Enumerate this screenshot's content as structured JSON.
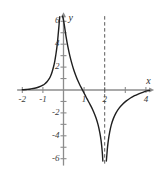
{
  "chart_data": {
    "type": "line",
    "title": "",
    "xlabel": "x",
    "ylabel": "y",
    "xlim": [
      -2.25,
      4.4
    ],
    "ylim": [
      -6.6,
      6.8
    ],
    "grid": false,
    "legend": null,
    "axis_color": "#8c8c8c",
    "curve_color": "#1f1f1f",
    "asymptote_color": "#5a5a5a",
    "x_ticks": [
      -2,
      -1,
      0,
      1,
      2,
      3,
      4
    ],
    "x_tick_labels": [
      "-2",
      "-1",
      "",
      "1",
      "2",
      "",
      "4"
    ],
    "y_ticks": [
      -6,
      -5,
      -4,
      -3,
      -2,
      -1,
      1,
      2,
      3,
      4,
      5,
      6
    ],
    "y_tick_labels": [
      "-6",
      "",
      "-4",
      "",
      "-2",
      "",
      "",
      "2",
      "",
      "4",
      "",
      "6"
    ],
    "asymptotes": [
      {
        "kind": "vertical",
        "x": 2,
        "style": "dashed"
      }
    ],
    "series": [
      {
        "name": "branch-left",
        "comment": "x from -2 to just left of 0, rising from y≈0 to y≈6.4",
        "points": [
          [
            -2.0,
            0.02
          ],
          [
            -1.8,
            0.05
          ],
          [
            -1.6,
            0.09
          ],
          [
            -1.4,
            0.15
          ],
          [
            -1.2,
            0.26
          ],
          [
            -1.0,
            0.42
          ],
          [
            -0.9,
            0.55
          ],
          [
            -0.8,
            0.72
          ],
          [
            -0.7,
            0.97
          ],
          [
            -0.62,
            1.25
          ],
          [
            -0.55,
            1.6
          ],
          [
            -0.48,
            2.05
          ],
          [
            -0.42,
            2.55
          ],
          [
            -0.37,
            3.1
          ],
          [
            -0.32,
            3.75
          ],
          [
            -0.28,
            4.4
          ],
          [
            -0.25,
            5.0
          ],
          [
            -0.22,
            5.6
          ],
          [
            -0.2,
            6.05
          ],
          [
            -0.18,
            6.4
          ]
        ]
      },
      {
        "name": "branch-middle",
        "comment": "x from just right of 0 down through zero near x=1 to y≈-6 near x=2",
        "points": [
          [
            -0.05,
            6.45
          ],
          [
            0.0,
            6.1
          ],
          [
            0.05,
            5.55
          ],
          [
            0.12,
            4.7
          ],
          [
            0.2,
            3.9
          ],
          [
            0.3,
            3.05
          ],
          [
            0.4,
            2.35
          ],
          [
            0.5,
            1.75
          ],
          [
            0.6,
            1.25
          ],
          [
            0.7,
            0.8
          ],
          [
            0.8,
            0.42
          ],
          [
            0.9,
            0.08
          ],
          [
            0.95,
            -0.1
          ],
          [
            1.05,
            -0.45
          ],
          [
            1.15,
            -0.8
          ],
          [
            1.3,
            -1.3
          ],
          [
            1.45,
            -1.85
          ],
          [
            1.58,
            -2.45
          ],
          [
            1.68,
            -3.05
          ],
          [
            1.76,
            -3.7
          ],
          [
            1.82,
            -4.35
          ],
          [
            1.86,
            -5.0
          ],
          [
            1.89,
            -5.6
          ],
          [
            1.91,
            -6.2
          ]
        ]
      },
      {
        "name": "branch-right",
        "comment": "x from just right of 2 rising from y≈-6 toward y≈0 at x≈4",
        "points": [
          [
            2.08,
            -6.2
          ],
          [
            2.11,
            -5.55
          ],
          [
            2.14,
            -4.95
          ],
          [
            2.18,
            -4.35
          ],
          [
            2.24,
            -3.7
          ],
          [
            2.32,
            -3.05
          ],
          [
            2.42,
            -2.5
          ],
          [
            2.55,
            -2.0
          ],
          [
            2.7,
            -1.58
          ],
          [
            2.88,
            -1.22
          ],
          [
            3.05,
            -0.95
          ],
          [
            3.25,
            -0.7
          ],
          [
            3.45,
            -0.5
          ],
          [
            3.65,
            -0.34
          ],
          [
            3.85,
            -0.2
          ],
          [
            4.05,
            -0.08
          ],
          [
            4.18,
            -0.03
          ]
        ]
      }
    ]
  }
}
